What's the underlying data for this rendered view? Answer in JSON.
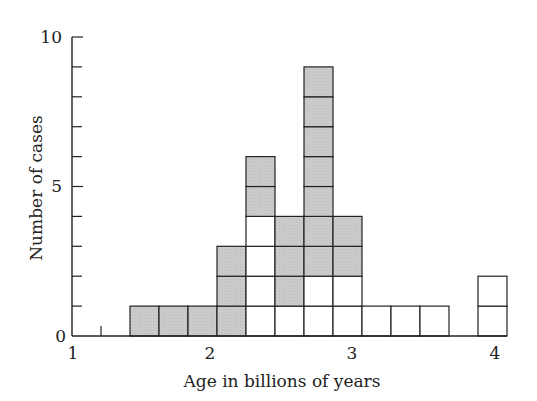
{
  "chart_data": {
    "type": "bar",
    "subtype": "stacked-histogram",
    "title": "",
    "xlabel": "Age in billions of years",
    "ylabel": "Number of cases",
    "xlim": [
      1,
      4
    ],
    "ylim": [
      0,
      10
    ],
    "x_ticks": [
      1,
      2,
      3,
      4
    ],
    "y_ticks": [
      0,
      5,
      10
    ],
    "y_minor_step": 1,
    "bin_width": 0.2,
    "grid": false,
    "legend": null,
    "colors": {
      "shaded": "#cfcfcf",
      "unshaded": "#ffffff",
      "stroke": "#222222"
    },
    "bins": [
      {
        "start": 1.4,
        "end": 1.6,
        "shaded": 1,
        "unshaded": 0
      },
      {
        "start": 1.6,
        "end": 1.8,
        "shaded": 1,
        "unshaded": 0
      },
      {
        "start": 1.8,
        "end": 2.0,
        "shaded": 1,
        "unshaded": 0
      },
      {
        "start": 2.0,
        "end": 2.2,
        "shaded": 3,
        "unshaded": 0
      },
      {
        "start": 2.2,
        "end": 2.4,
        "shaded": 2,
        "unshaded": 4
      },
      {
        "start": 2.4,
        "end": 2.6,
        "shaded": 3,
        "unshaded": 1
      },
      {
        "start": 2.6,
        "end": 2.8,
        "shaded": 7,
        "unshaded": 2
      },
      {
        "start": 2.8,
        "end": 3.0,
        "shaded": 2,
        "unshaded": 2
      },
      {
        "start": 3.0,
        "end": 3.2,
        "shaded": 0,
        "unshaded": 1
      },
      {
        "start": 3.2,
        "end": 3.4,
        "shaded": 0,
        "unshaded": 1
      },
      {
        "start": 3.4,
        "end": 3.6,
        "shaded": 0,
        "unshaded": 1
      },
      {
        "start": 3.8,
        "end": 4.0,
        "shaded": 0,
        "unshaded": 2
      }
    ],
    "series": [
      {
        "name": "unshaded",
        "values": [
          0,
          0,
          0,
          0,
          4,
          1,
          2,
          2,
          1,
          1,
          1,
          2
        ]
      },
      {
        "name": "shaded",
        "values": [
          1,
          1,
          1,
          3,
          2,
          3,
          7,
          2,
          0,
          0,
          0,
          0
        ]
      }
    ],
    "categories": [
      "1.4-1.6",
      "1.6-1.8",
      "1.8-2.0",
      "2.0-2.2",
      "2.2-2.4",
      "2.4-2.6",
      "2.6-2.8",
      "2.8-3.0",
      "3.0-3.2",
      "3.2-3.4",
      "3.4-3.6",
      "3.8-4.0"
    ],
    "totals": [
      1,
      1,
      1,
      3,
      6,
      4,
      9,
      4,
      1,
      1,
      1,
      2
    ],
    "annotations": [
      "minor x tick at 1.2"
    ]
  },
  "labels": {
    "xlabel": "Age in billions of years",
    "ylabel": "Number of cases",
    "x_tick_labels": [
      "1",
      "2",
      "3",
      "4"
    ],
    "y_tick_labels": [
      "0",
      "5",
      "10"
    ]
  }
}
